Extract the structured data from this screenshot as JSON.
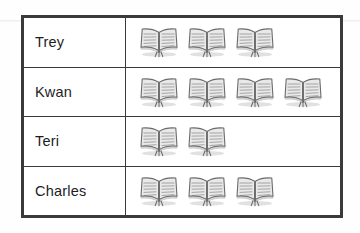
{
  "document": {
    "kind": "pictograph-table",
    "title": "Books read pictograph",
    "icon_name": "open-book-icon",
    "icon_meaning": "book"
  },
  "table": {
    "columns": [
      "name",
      "books"
    ],
    "rows": [
      {
        "name": "Trey",
        "count": 3
      },
      {
        "name": "Kwan",
        "count": 4
      },
      {
        "name": "Teri",
        "count": 2
      },
      {
        "name": "Charles",
        "count": 3
      }
    ]
  },
  "colors": {
    "border": "#3a3a3a",
    "background": "#ffffff",
    "text": "#1d1d1d",
    "icon_outline": "#6b6b6b",
    "icon_fill": "#e9e9e9",
    "icon_shadow": "#9a9a9a"
  },
  "chart_data": {
    "type": "bar",
    "chart_subtype": "pictograph",
    "categories": [
      "Trey",
      "Kwan",
      "Teri",
      "Charles"
    ],
    "values": [
      3,
      4,
      2,
      3
    ],
    "unit_symbol": "open book",
    "unit_value": 1,
    "xlabel": "",
    "ylabel": "",
    "legend": [],
    "grid": false
  }
}
